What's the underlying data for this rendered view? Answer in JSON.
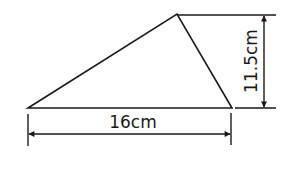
{
  "diagram": {
    "type": "triangle-with-dimensions",
    "stroke_color": "#1a1a1a",
    "background": "#ffffff",
    "vertices": {
      "left": [
        28,
        108
      ],
      "apex": [
        177,
        14
      ],
      "right": [
        232,
        108
      ]
    },
    "dimensions": {
      "base": {
        "label": "16cm",
        "value": 16,
        "unit": "cm"
      },
      "height": {
        "label": "11.5cm",
        "value": 11.5,
        "unit": "cm"
      }
    }
  }
}
